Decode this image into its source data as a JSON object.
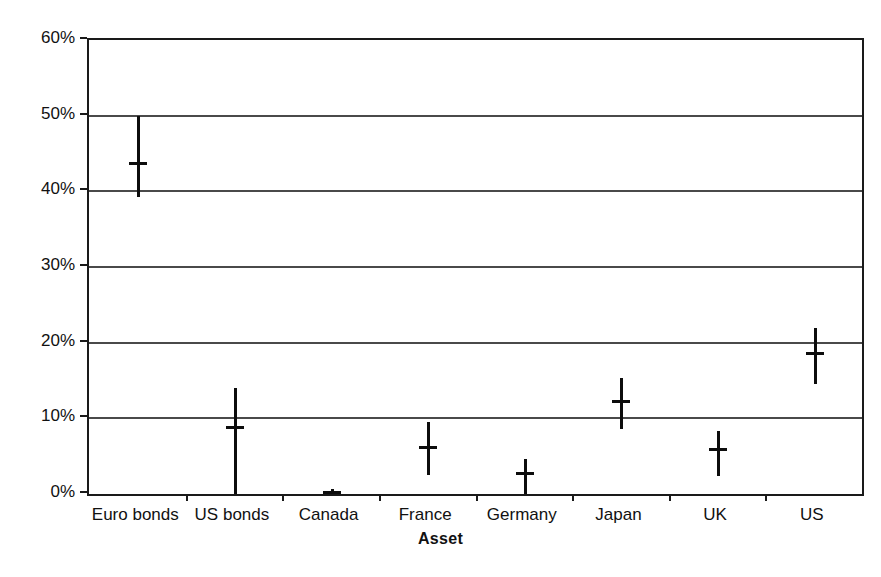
{
  "chart_data": {
    "type": "scatter",
    "title": "",
    "xlabel": "Asset",
    "ylabel": "Weight",
    "ylim": [
      0,
      60
    ],
    "yticks": [
      "0%",
      "10%",
      "20%",
      "30%",
      "40%",
      "50%",
      "60%"
    ],
    "ytick_values": [
      0,
      10,
      20,
      30,
      40,
      50,
      60
    ],
    "grid": "horizontal",
    "legend": "none",
    "categories": [
      "Euro bonds",
      "US bonds",
      "Canada",
      "France",
      "Germany",
      "Japan",
      "UK",
      "US"
    ],
    "series": [
      {
        "name": "Weight",
        "marker": "mean-with-range-bar",
        "values": [
          43.7,
          8.9,
          0.3,
          6.2,
          2.8,
          12.3,
          6.0,
          18.6
        ],
        "low": [
          39.2,
          0.0,
          0.0,
          2.5,
          0.0,
          8.6,
          2.4,
          14.5
        ],
        "high": [
          50.0,
          14.0,
          0.6,
          9.5,
          4.6,
          15.3,
          8.3,
          22.0
        ]
      }
    ],
    "points": [
      {
        "category": "Euro bonds",
        "value": 43.7,
        "low": 39.2,
        "high": 50.0
      },
      {
        "category": "US bonds",
        "value": 8.9,
        "low": 0.0,
        "high": 14.0
      },
      {
        "category": "Canada",
        "value": 0.3,
        "low": 0.0,
        "high": 0.6
      },
      {
        "category": "France",
        "value": 6.2,
        "low": 2.5,
        "high": 9.5
      },
      {
        "category": "Germany",
        "value": 2.8,
        "low": 0.0,
        "high": 4.6
      },
      {
        "category": "Japan",
        "value": 12.3,
        "low": 8.6,
        "high": 15.3
      },
      {
        "category": "UK",
        "value": 6.0,
        "low": 2.4,
        "high": 8.3
      },
      {
        "category": "US",
        "value": 18.6,
        "low": 14.5,
        "high": 22.0
      }
    ],
    "colors": {
      "marker": "#0d0d0d",
      "gridline": "#4a4a4a",
      "axis": "#1a1a1a",
      "background": "#ffffff",
      "text": "#111111"
    }
  }
}
